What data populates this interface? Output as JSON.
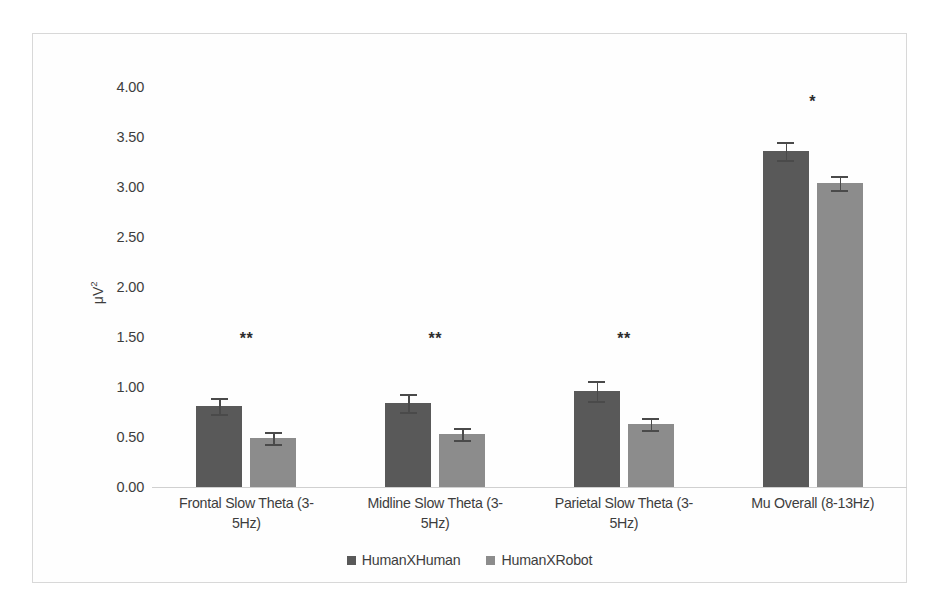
{
  "chart_data": {
    "type": "bar",
    "title": "",
    "xlabel": "",
    "ylabel": "μV²",
    "ylim": [
      0,
      4.0
    ],
    "ytick_labels": [
      "4.00",
      "3.50",
      "3.00",
      "2.50",
      "2.00",
      "1.50",
      "1.00",
      "0.50",
      "0.00"
    ],
    "ytick_values": [
      4.0,
      3.5,
      3.0,
      2.5,
      2.0,
      1.5,
      1.0,
      0.5,
      0.0
    ],
    "grid": false,
    "legend_position": "bottom",
    "categories": [
      "Frontal Slow Theta (3-5Hz)",
      "Midline Slow Theta (3-5Hz)",
      "Parietal Slow Theta (3-5Hz)",
      "Mu Overall (8-13Hz)"
    ],
    "category_lines": [
      [
        "Frontal Slow Theta (3-",
        "5Hz)"
      ],
      [
        "Midline Slow Theta (3-",
        "5Hz)"
      ],
      [
        "Parietal Slow Theta (3-",
        "5Hz)"
      ],
      [
        "Mu Overall (8-13Hz)",
        ""
      ]
    ],
    "series": [
      {
        "name": "HumanXHuman",
        "color": "#595959",
        "values": [
          0.81,
          0.84,
          0.96,
          3.36
        ],
        "errors": [
          0.08,
          0.09,
          0.1,
          0.09
        ]
      },
      {
        "name": "HumanXRobot",
        "color": "#8c8c8c",
        "values": [
          0.49,
          0.53,
          0.63,
          3.04
        ],
        "errors": [
          0.06,
          0.06,
          0.06,
          0.07
        ]
      }
    ],
    "annotations": [
      {
        "category": "Frontal Slow Theta (3-5Hz)",
        "text": "**",
        "value": 1.47
      },
      {
        "category": "Midline Slow Theta (3-5Hz)",
        "text": "**",
        "value": 1.47
      },
      {
        "category": "Parietal Slow Theta (3-5Hz)",
        "text": "**",
        "value": 1.47
      },
      {
        "category": "Mu Overall (8-13Hz)",
        "text": "*",
        "value": 3.84
      }
    ]
  }
}
